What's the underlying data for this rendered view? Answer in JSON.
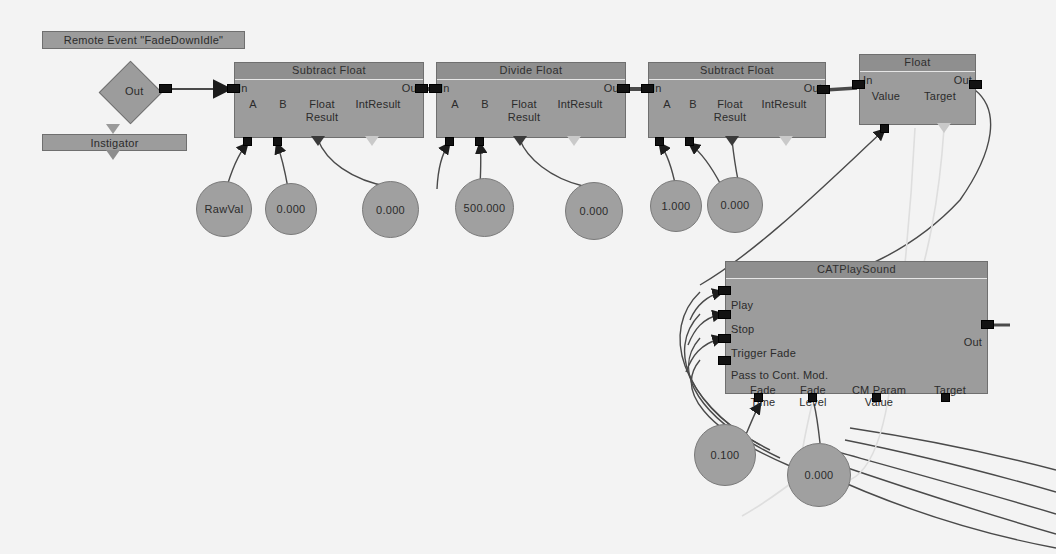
{
  "canvas": {
    "width": 1056,
    "height": 554,
    "background": "#f3f3f3",
    "node_body_color": "#9c9c9c",
    "node_header_color": "#8f8f8f",
    "wire_color": "#4a4a4a",
    "wire_color_light": "#d8d8d8",
    "pin_color": "#121212",
    "text_color": "#2b2b2b"
  },
  "event": {
    "title": "Remote Event \"FadeDownIdle\"",
    "out_label": "Out",
    "instigator_label": "Instigator"
  },
  "nodes": [
    {
      "id": "subtract-float-1",
      "title": "Subtract Float",
      "in_label": "In",
      "out_label": "Out",
      "inputs": [
        "A",
        "B"
      ],
      "outputs": [
        "Float Result",
        "IntResult"
      ],
      "float_result_line1": "Float",
      "float_result_line2": "Result"
    },
    {
      "id": "divide-float",
      "title": "Divide Float",
      "in_label": "In",
      "out_label": "Out",
      "inputs": [
        "A",
        "B"
      ],
      "outputs": [
        "Float Result",
        "IntResult"
      ],
      "float_result_line1": "Float",
      "float_result_line2": "Result"
    },
    {
      "id": "subtract-float-2",
      "title": "Subtract Float",
      "in_label": "In",
      "out_label": "Out",
      "inputs": [
        "A",
        "B"
      ],
      "outputs": [
        "Float Result",
        "IntResult"
      ],
      "float_result_line1": "Float",
      "float_result_line2": "Result"
    },
    {
      "id": "float-var-node",
      "title": "Float",
      "in_label": "In",
      "out_label": "Out",
      "inputs": [
        "Value"
      ],
      "outputs": [
        "Target"
      ]
    },
    {
      "id": "cat-play-sound",
      "title": "CATPlaySound",
      "out_label": "Out",
      "input_events": [
        "Play",
        "Stop",
        "Trigger Fade",
        "Pass to Cont. Mod."
      ],
      "bottom_pins": [
        {
          "line1": "Fade",
          "line2": "Time"
        },
        {
          "line1": "Fade",
          "line2": "Level"
        },
        {
          "line1": "CM Param",
          "line2": "Value"
        },
        {
          "line1": "Target",
          "line2": ""
        }
      ]
    }
  ],
  "variables": [
    {
      "id": "rawval",
      "label": "RawVal"
    },
    {
      "id": "var-a1",
      "label": "0.000"
    },
    {
      "id": "var-b1",
      "label": "0.000"
    },
    {
      "id": "var-500",
      "label": "500.000"
    },
    {
      "id": "var-b2",
      "label": "0.000"
    },
    {
      "id": "var-one",
      "label": "1.000"
    },
    {
      "id": "var-b3",
      "label": "0.000"
    },
    {
      "id": "var-fadetime",
      "label": "0.100"
    },
    {
      "id": "var-fadelevel",
      "label": "0.000"
    }
  ]
}
